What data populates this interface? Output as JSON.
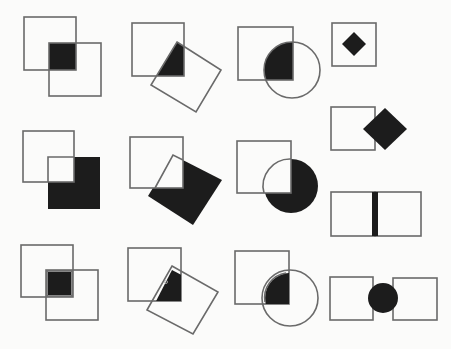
{
  "diagram": {
    "title": "",
    "colors": {
      "background": "#fbfbfa",
      "stroke": "#6a6a6a",
      "fill": "#1c1c1c"
    },
    "figures": [
      {
        "id": "r1c1",
        "kind": "square-square-intersection",
        "shaded": "intersection"
      },
      {
        "id": "r1c2",
        "kind": "square-rotated-square-intersection",
        "shaded": "intersection"
      },
      {
        "id": "r1c3",
        "kind": "square-circle-intersection",
        "shaded": "intersection"
      },
      {
        "id": "r1c4",
        "kind": "square-with-inner-diamond",
        "shaded": "diamond"
      },
      {
        "id": "r2c1",
        "kind": "square-square-difference",
        "shaded": "second-square-minus-overlap"
      },
      {
        "id": "r2c2",
        "kind": "square-rotated-square-difference",
        "shaded": "rotated-square-minus-overlap"
      },
      {
        "id": "r2c3",
        "kind": "square-circle-difference",
        "shaded": "circle-minus-overlap"
      },
      {
        "id": "r2c4",
        "kind": "square-with-edge-diamond",
        "shaded": "diamond"
      },
      {
        "id": "r3c1",
        "kind": "square-square-intersection-outlined",
        "shaded": "intersection"
      },
      {
        "id": "r3c2",
        "kind": "square-rotated-square-intersection-outlined",
        "shaded": "intersection"
      },
      {
        "id": "r3c3",
        "kind": "square-circle-intersection-outlined",
        "shaded": "intersection"
      },
      {
        "id": "r3c4",
        "kind": "two-squares-shared-edge",
        "shaded": "shared-edge-bar"
      },
      {
        "id": "r4c4",
        "kind": "two-squares-with-circle-between",
        "shaded": "circle"
      }
    ]
  }
}
